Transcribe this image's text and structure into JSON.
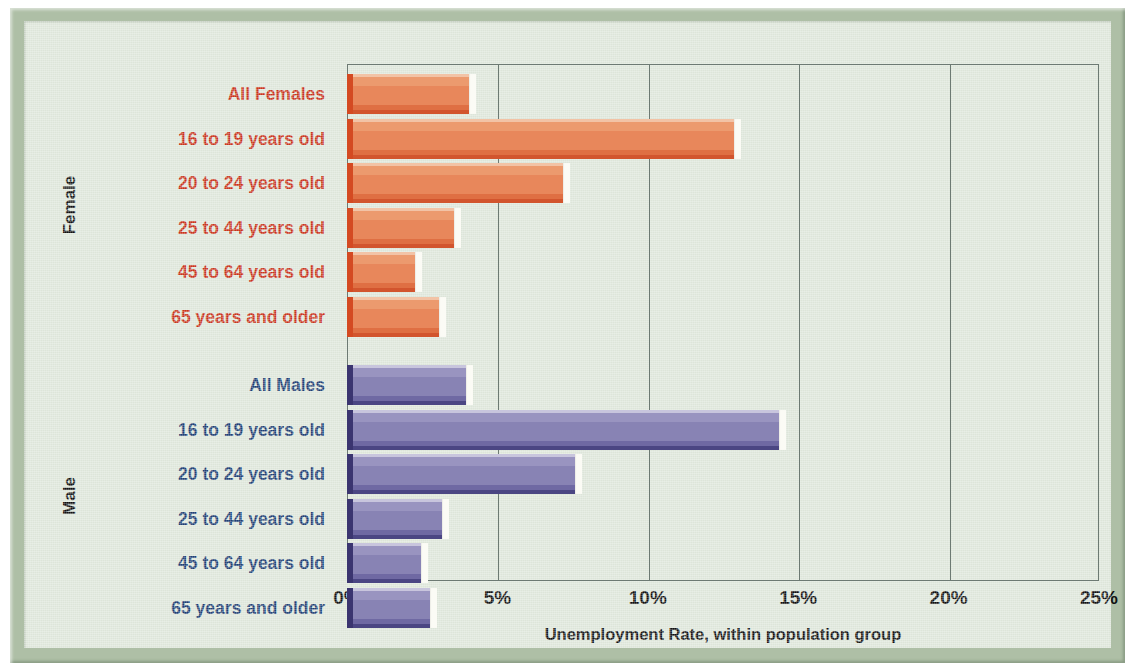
{
  "chart_data": {
    "type": "bar",
    "orientation": "horizontal",
    "title": "",
    "xlabel": "Unemployment Rate, within population group",
    "ylabel": "",
    "xlim": [
      0,
      25
    ],
    "xticks": [
      "0%",
      "5%",
      "10%",
      "15%",
      "20%",
      "25%"
    ],
    "xtick_values": [
      0,
      5,
      10,
      15,
      20,
      25
    ],
    "grid": true,
    "legend": "none",
    "groups": [
      {
        "name": "Female",
        "color": "#e8875b",
        "label_color": "#c8341b",
        "categories": [
          "All Females",
          "16 to 19 years old",
          "20 to 24 years old",
          "25 to 44 years old",
          "45 to 64 years old",
          "65 years and older"
        ],
        "values": [
          4.3,
          13.1,
          7.4,
          3.8,
          2.5,
          3.3
        ]
      },
      {
        "name": "Male",
        "color": "#8883b4",
        "label_color": "#1f3f73",
        "categories": [
          "All Males",
          "16 to 19 years old",
          "20 to 24 years old",
          "25 to 44 years old",
          "45 to 64 years old",
          "65 years and older"
        ],
        "values": [
          4.2,
          14.6,
          7.8,
          3.4,
          2.7,
          3.0
        ]
      }
    ]
  },
  "colors": {
    "frame": "#aebfa6",
    "panel": "#dde5d9",
    "axis": "#6d7a73",
    "female_bar": "#e8875b",
    "female_bar_edge": "#d44a22",
    "male_bar": "#8883b4",
    "male_bar_edge": "#3b3570",
    "female_text": "#c8341b",
    "male_text": "#1f3f73"
  }
}
